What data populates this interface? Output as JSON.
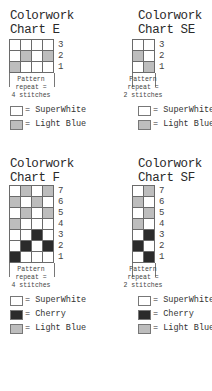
{
  "colors": {
    "SuperWhite": "#ffffff",
    "LightBlue": "#bdbdbd",
    "Cherry": "#2b2b2b",
    "gridline": "#6a6a6a"
  },
  "charts": [
    {
      "id": "E",
      "title_line1": "Colorwork",
      "title_line2": "Chart E",
      "columns": 4,
      "rows_top_to_bottom": [
        {
          "num": "3",
          "cells": [
            "W",
            "W",
            "W",
            "W"
          ]
        },
        {
          "num": "2",
          "cells": [
            "W",
            "B",
            "W",
            "B"
          ]
        },
        {
          "num": "1",
          "cells": [
            "B",
            "W",
            "W",
            "W"
          ]
        }
      ],
      "repeat_line1": "Pattern",
      "repeat_line2": "repeat =",
      "repeat_line3": "4 stitches",
      "legend": [
        {
          "key": "W",
          "label": "= SuperWhite"
        },
        {
          "key": "B",
          "label": "= Light Blue"
        }
      ]
    },
    {
      "id": "SE",
      "title_line1": "Colorwork",
      "title_line2": "Chart SE",
      "columns": 2,
      "rows_top_to_bottom": [
        {
          "num": "3",
          "cells": [
            "W",
            "W"
          ]
        },
        {
          "num": "2",
          "cells": [
            "B",
            "W"
          ]
        },
        {
          "num": "1",
          "cells": [
            "W",
            "B"
          ]
        }
      ],
      "repeat_line1": "Pattern",
      "repeat_line2": "repeat =",
      "repeat_line3": "2 stitches",
      "legend": [
        {
          "key": "W",
          "label": "= SuperWhite"
        },
        {
          "key": "B",
          "label": "= Light Blue"
        }
      ]
    },
    {
      "id": "F",
      "title_line1": "Colorwork",
      "title_line2": "Chart F",
      "columns": 4,
      "rows_top_to_bottom": [
        {
          "num": "7",
          "cells": [
            "W",
            "B",
            "W",
            "B"
          ]
        },
        {
          "num": "6",
          "cells": [
            "B",
            "W",
            "B",
            "W"
          ]
        },
        {
          "num": "5",
          "cells": [
            "W",
            "B",
            "W",
            "B"
          ]
        },
        {
          "num": "4",
          "cells": [
            "B",
            "W",
            "W",
            "W"
          ]
        },
        {
          "num": "3",
          "cells": [
            "W",
            "W",
            "C",
            "W"
          ]
        },
        {
          "num": "2",
          "cells": [
            "W",
            "C",
            "W",
            "C"
          ]
        },
        {
          "num": "1",
          "cells": [
            "C",
            "W",
            "W",
            "W"
          ]
        }
      ],
      "repeat_line1": "Pattern",
      "repeat_line2": "repeat =",
      "repeat_line3": "4 stitches",
      "legend": [
        {
          "key": "W",
          "label": "= SuperWhite"
        },
        {
          "key": "C",
          "label": "= Cherry"
        },
        {
          "key": "B",
          "label": "= Light Blue"
        }
      ]
    },
    {
      "id": "SF",
      "title_line1": "Colorwork",
      "title_line2": "Chart SF",
      "columns": 2,
      "rows_top_to_bottom": [
        {
          "num": "7",
          "cells": [
            "W",
            "B"
          ]
        },
        {
          "num": "6",
          "cells": [
            "B",
            "W"
          ]
        },
        {
          "num": "5",
          "cells": [
            "W",
            "B"
          ]
        },
        {
          "num": "4",
          "cells": [
            "B",
            "W"
          ]
        },
        {
          "num": "3",
          "cells": [
            "W",
            "C"
          ]
        },
        {
          "num": "2",
          "cells": [
            "C",
            "W"
          ]
        },
        {
          "num": "1",
          "cells": [
            "W",
            "C"
          ]
        }
      ],
      "repeat_line1": "Pattern",
      "repeat_line2": "repeat =",
      "repeat_line3": "2 stitches",
      "legend": [
        {
          "key": "W",
          "label": "= SuperWhite"
        },
        {
          "key": "C",
          "label": "= Cherry"
        },
        {
          "key": "B",
          "label": "= Light Blue"
        }
      ]
    }
  ]
}
